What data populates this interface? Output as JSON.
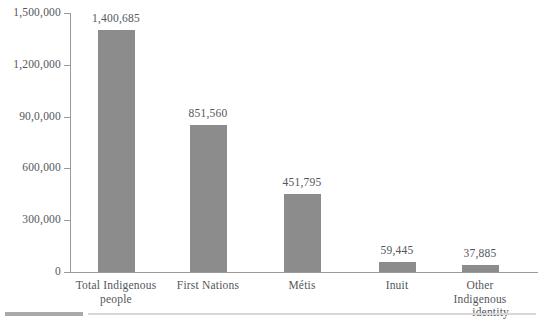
{
  "chart_data": {
    "type": "bar",
    "title": "",
    "subtitle": "",
    "xlabel": "",
    "ylabel": "",
    "ylim": [
      0,
      1500000
    ],
    "yticks": [
      0,
      300000,
      600000,
      900000,
      1200000,
      1500000
    ],
    "ytick_labels": [
      "0",
      "300,000",
      "600,000",
      "90,0,000",
      "1,200,000",
      "1,500,000"
    ],
    "grid": false,
    "legend": false,
    "bar_color": "#8c8c8c",
    "axis_color": "#9a9a9a",
    "text_color": "#55565a",
    "categories": [
      "Total Indigenous people",
      "First Nations",
      "Métis",
      "Inuit",
      "Other Indigenous identity"
    ],
    "values": [
      1400685,
      851560,
      451795,
      59445,
      37885
    ],
    "data_labels": [
      "1,400,685",
      "851,560",
      "451,795",
      "59,445",
      "37,885"
    ],
    "category_lines": [
      [
        "Total Indigenous",
        "people"
      ],
      [
        "First Nations",
        ""
      ],
      [
        "Métis",
        ""
      ],
      [
        "Inuit",
        ""
      ],
      [
        "Other Indigenous",
        "identity"
      ]
    ]
  },
  "footer": {
    "rule_left_color": "#a9a9ac",
    "rule_right_color": "#d8d8da"
  }
}
